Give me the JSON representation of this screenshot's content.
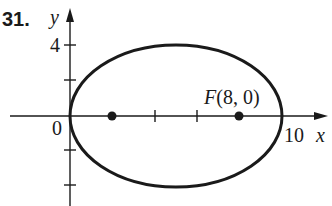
{
  "problem_number": "31.",
  "axes": {
    "x_label": "x",
    "y_label": "y",
    "origin_label": "0",
    "y_tick_label": "4",
    "x_tick_label": "10"
  },
  "ellipse": {
    "center": [
      5,
      0
    ],
    "semi_major": 5,
    "semi_minor": 4,
    "vertices": [
      [
        0,
        0
      ],
      [
        10,
        0
      ]
    ],
    "foci": [
      [
        2,
        0
      ],
      [
        8,
        0
      ]
    ]
  },
  "focus_label": {
    "letter": "F",
    "coords": "(8, 0)"
  },
  "colors": {
    "stroke": "#1a1a1a",
    "background": "#ffffff"
  }
}
